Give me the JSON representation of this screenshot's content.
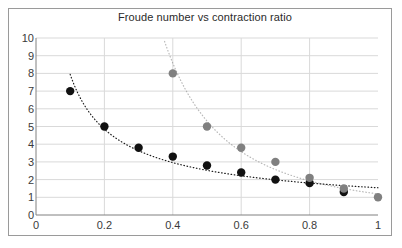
{
  "chart_data": {
    "type": "scatter",
    "title": "Froude number vs contraction ratio",
    "xlabel": "",
    "ylabel": "",
    "xlim": [
      0,
      1
    ],
    "ylim": [
      0,
      10
    ],
    "xticks": [
      "0",
      "0.2",
      "0.4",
      "0.6",
      "0.8",
      "1"
    ],
    "xtick_values": [
      0,
      0.2,
      0.4,
      0.6,
      0.8,
      1
    ],
    "yticks": [
      "0",
      "1",
      "2",
      "3",
      "4",
      "5",
      "6",
      "7",
      "8",
      "9",
      "10"
    ],
    "ytick_values": [
      0,
      1,
      2,
      3,
      4,
      5,
      6,
      7,
      8,
      9,
      10
    ],
    "grid": "horizontal-and-vertical",
    "legend": "none",
    "series": [
      {
        "name": "lower-series",
        "color": "#111111",
        "marker": "filled-circle",
        "trendline": "dotted",
        "x": [
          0.1,
          0.2,
          0.3,
          0.4,
          0.5,
          0.6,
          0.7,
          0.8,
          0.9
        ],
        "values": [
          7.0,
          5.0,
          3.8,
          3.3,
          2.8,
          2.4,
          2.0,
          1.8,
          1.3
        ]
      },
      {
        "name": "upper-series",
        "color": "#808080",
        "marker": "filled-circle",
        "trendline": "dotted",
        "x": [
          0.4,
          0.5,
          0.6,
          0.7,
          0.8,
          0.9,
          1.0
        ],
        "values": [
          8.0,
          5.0,
          3.8,
          3.0,
          2.1,
          1.5,
          1.0
        ]
      }
    ]
  },
  "colors": {
    "plot_background": "#ffffff",
    "border": "#9a9a9a",
    "gridline": "#d9d9d9",
    "axis": "#808080",
    "tick_label": "#3a3a3a",
    "title_text": "#2a2a2a",
    "series_dark": "#111111",
    "series_gray": "#808080"
  }
}
